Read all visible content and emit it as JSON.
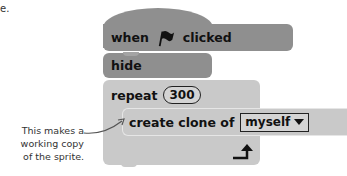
{
  "corner_text": "e.",
  "script": {
    "hat_block": {
      "label_before": "when",
      "icon": "green-flag-icon",
      "label_after": "clicked",
      "color": "#8f8f8f"
    },
    "hide_block": {
      "label": "hide",
      "color": "#8f8f8f"
    },
    "repeat_block": {
      "label": "repeat",
      "count": "300",
      "color": "#c9c9c9",
      "loop_arrow_icon": "loop-arrow-icon"
    },
    "clone_block": {
      "label": "create clone of",
      "target": "myself",
      "color": "#c9c9c9"
    }
  },
  "annotation": {
    "lines": [
      "This makes a",
      "working copy",
      "of the sprite."
    ],
    "text": "This makes a working copy of the sprite."
  }
}
